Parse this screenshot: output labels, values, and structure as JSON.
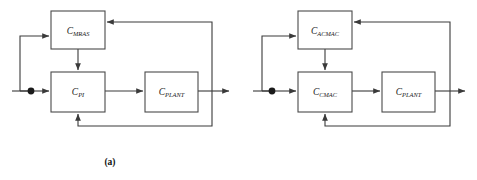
{
  "figure": {
    "background_color": "#ffffff",
    "line_color": "#3a3a3a",
    "box_border_color": "#4a4a4a",
    "label_color": "#1a1a1a",
    "panels": [
      {
        "id": "a",
        "caption": "(a)",
        "blocks": [
          {
            "name": "adaptive-block",
            "base": "C",
            "sub": "MRAS",
            "x": 51,
            "y": 11,
            "w": 54,
            "h": 38
          },
          {
            "name": "controller-block",
            "base": "C",
            "sub": "PI",
            "x": 51,
            "y": 72,
            "w": 54,
            "h": 40
          },
          {
            "name": "plant-block",
            "base": "C",
            "sub": "PLANT",
            "x": 145,
            "y": 72,
            "w": 53,
            "h": 40
          }
        ],
        "junction": {
          "name": "summing-junction-node",
          "x": 31,
          "y": 91,
          "r": 3.4
        },
        "signal_entry_x": 12,
        "signal_line_y": 91,
        "output_arrow_x": 231,
        "feedback_vertical_x": 212,
        "feedback_top_y": 22,
        "feedback_bottom_y": 126,
        "adaptive_branch_x": 20,
        "adaptive_entry_y": 36,
        "adaptive_to_controller_x": 78
      },
      {
        "id": "b",
        "caption": "(b)",
        "blocks": [
          {
            "name": "adaptive-block",
            "base": "C",
            "sub": "ACMAC",
            "x": 58,
            "y": 11,
            "w": 54,
            "h": 38
          },
          {
            "name": "controller-block",
            "base": "C",
            "sub": "CMAC",
            "x": 58,
            "y": 72,
            "w": 54,
            "h": 40
          },
          {
            "name": "plant-block",
            "base": "C",
            "sub": "PLANT",
            "x": 142,
            "y": 72,
            "w": 53,
            "h": 40
          }
        ],
        "junction": {
          "name": "summing-junction-node",
          "x": 32,
          "y": 91,
          "r": 3.4
        },
        "signal_entry_x": 13,
        "signal_line_y": 91,
        "output_arrow_x": 227,
        "feedback_vertical_x": 210,
        "feedback_top_y": 22,
        "feedback_bottom_y": 126,
        "adaptive_branch_x": 22,
        "adaptive_entry_y": 36,
        "adaptive_to_controller_x": 85
      }
    ]
  }
}
